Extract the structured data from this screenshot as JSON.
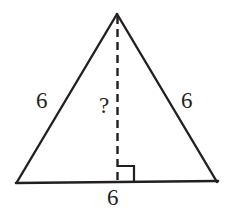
{
  "figure": {
    "type": "isosceles-triangle-with-altitude",
    "labels": {
      "left_side": "6",
      "right_side": "6",
      "base": "6",
      "height": "?"
    },
    "colors": {
      "stroke": "#231f20",
      "background": "#ffffff",
      "text": "#231f20"
    },
    "geometry": {
      "apex": [
        117,
        14
      ],
      "bottom_left": [
        17,
        182
      ],
      "bottom_right": [
        217,
        182
      ],
      "altitude_foot": [
        117,
        182
      ],
      "right_angle_marker": {
        "x": 118,
        "y": 166,
        "size": 16,
        "side": "right-of-altitude"
      },
      "dash_pattern": "8 5",
      "solid_stroke_width": 2.4,
      "dashed_stroke_width": 2.4
    }
  }
}
